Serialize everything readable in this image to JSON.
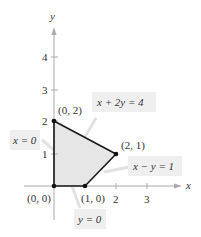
{
  "diagram": {
    "axes": {
      "x_label": "x",
      "y_label": "y",
      "x_ticks": [
        "2",
        "3"
      ],
      "y_ticks": [
        "1",
        "2",
        "3",
        "4"
      ]
    },
    "region": {
      "vertices": [
        [
          0,
          0
        ],
        [
          1,
          0
        ],
        [
          2,
          1
        ],
        [
          0,
          2
        ]
      ],
      "fill": "#e6e6e6",
      "stroke": "#1a1a1a"
    },
    "points": [
      {
        "label": "(0, 0)"
      },
      {
        "label": "(1, 0)"
      },
      {
        "label": "(2, 1)"
      },
      {
        "label": "(0, 2)"
      }
    ],
    "constraints": [
      {
        "label": "x + 2y = 4"
      },
      {
        "label": "x − y = 1"
      },
      {
        "label": "x = 0"
      },
      {
        "label": "y = 0"
      }
    ],
    "colors": {
      "axis": "#aaaaaa",
      "label_box": "#efefef",
      "callout_line": "#dddddd"
    }
  }
}
